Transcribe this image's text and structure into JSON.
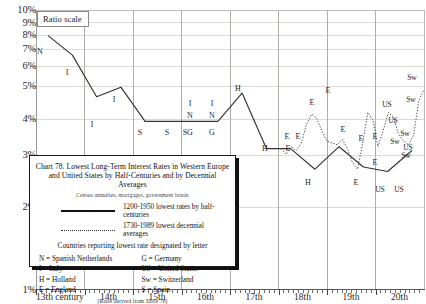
{
  "chart_data": {
    "type": "line",
    "title": "Chart 78. Lowest Long-Term Interest Rates in Western Europe and United States by Half-Centuries and by Decennial Averages",
    "subtitle": "Census annuities, mortgages, government bonds",
    "source_note": "(Rates derived from Table 76)",
    "ylabel": "",
    "xlabel": "",
    "scale_note": "Ratio scale",
    "yscale": "log",
    "ylim": [
      1,
      10
    ],
    "ytick_labels": [
      "10%",
      "9%",
      "8%",
      "7%",
      "6%",
      "5%",
      "4%",
      "3%",
      "2%",
      "1%"
    ],
    "ytick_values": [
      10,
      9,
      8,
      7,
      6,
      5,
      4,
      3,
      2,
      1
    ],
    "xtick_labels": [
      "13th century",
      "14th",
      "15th",
      "16th",
      "17th",
      "18th",
      "19th",
      "20th"
    ],
    "legend": [
      {
        "style": "solid",
        "label": "1200-1950 lowest rates by half-centuries"
      },
      {
        "style": "dotted",
        "label": "1730-1989 lowest decennial averages"
      }
    ],
    "key_note": "Countries reporting lowest rate designated by letter",
    "key_left": [
      "N = Spanish Netherlands",
      "I = Italy",
      "H = Holland",
      "E = England"
    ],
    "key_right": [
      "G = Germany",
      "US = United States",
      "Sw = Switzerland",
      "S = Spain"
    ],
    "series": [
      {
        "name": "1200-1950 lowest rates by half-centuries",
        "style": "solid",
        "points": [
          {
            "century": "13th-1",
            "value": 8.1
          },
          {
            "century": "13th-2",
            "value": 6.9
          },
          {
            "century": "14th-1",
            "value": 4.9
          },
          {
            "century": "14th-2",
            "value": 5.3
          },
          {
            "century": "15th-1",
            "value": 4.0
          },
          {
            "century": "15th-2",
            "value": 4.0
          },
          {
            "century": "16th-1",
            "value": 4.0
          },
          {
            "century": "16th-2",
            "value": 4.0
          },
          {
            "century": "17th-1",
            "value": 5.05
          },
          {
            "century": "17th-2",
            "value": 3.2
          },
          {
            "century": "18th-1",
            "value": 3.2
          },
          {
            "century": "18th-2",
            "value": 2.7
          },
          {
            "century": "19th-1",
            "value": 3.25
          },
          {
            "century": "19th-2",
            "value": 2.75
          },
          {
            "century": "20th-1",
            "value": 2.65
          },
          {
            "century": "20th-2",
            "value": 3.15
          }
        ]
      },
      {
        "name": "1730-1989 lowest decennial averages",
        "style": "dotted",
        "values": [
          3.2,
          3.05,
          3.25,
          3.15,
          3.35,
          3.9,
          4.25,
          4.1,
          3.7,
          3.4,
          3.35,
          3.3,
          3.45,
          3.2,
          2.85,
          2.7,
          3.35,
          4.3,
          4.05,
          3.25,
          3.7,
          4.3,
          4.15,
          3.6,
          3.4,
          3.3,
          3.6,
          4.75,
          5.2
        ]
      }
    ],
    "solid_letters": [
      {
        "label": "N",
        "x": 40,
        "y": 52
      },
      {
        "label": "I",
        "x": 67,
        "y": 73
      },
      {
        "label": "I",
        "x": 92,
        "y": 125
      },
      {
        "label": "I",
        "x": 114,
        "y": 100
      },
      {
        "label": "S",
        "x": 140,
        "y": 133
      },
      {
        "label": "S",
        "x": 167,
        "y": 133
      },
      {
        "label": "S",
        "x": 185,
        "y": 133
      },
      {
        "label": "G",
        "x": 190,
        "y": 133
      },
      {
        "label": "I",
        "x": 190,
        "y": 104
      },
      {
        "label": "N",
        "x": 190,
        "y": 116
      },
      {
        "label": "G",
        "x": 212,
        "y": 133
      },
      {
        "label": "I",
        "x": 212,
        "y": 104
      },
      {
        "label": "N",
        "x": 212,
        "y": 116
      },
      {
        "label": "H",
        "x": 238,
        "y": 89
      },
      {
        "label": "H",
        "x": 265,
        "y": 149
      },
      {
        "label": "E",
        "x": 288,
        "y": 149
      },
      {
        "label": "H",
        "x": 308,
        "y": 183
      },
      {
        "label": "E",
        "x": 356,
        "y": 183
      },
      {
        "label": "E",
        "x": 375,
        "y": 163
      },
      {
        "label": "US",
        "x": 380,
        "y": 190
      },
      {
        "label": "US",
        "x": 399,
        "y": 190
      }
    ],
    "dotted_letters": [
      {
        "label": "E",
        "x": 287,
        "y": 137
      },
      {
        "label": "E",
        "x": 298,
        "y": 137
      },
      {
        "label": "E",
        "x": 312,
        "y": 103
      },
      {
        "label": "E",
        "x": 328,
        "y": 91
      },
      {
        "label": "E",
        "x": 343,
        "y": 130
      },
      {
        "label": "E",
        "x": 361,
        "y": 139
      },
      {
        "label": "E",
        "x": 375,
        "y": 137
      },
      {
        "label": "US",
        "x": 387,
        "y": 105
      },
      {
        "label": "US",
        "x": 393,
        "y": 121
      },
      {
        "label": "Sw",
        "x": 395,
        "y": 142
      },
      {
        "label": "Sw",
        "x": 405,
        "y": 134
      },
      {
        "label": "Sw",
        "x": 406,
        "y": 156
      },
      {
        "label": "US",
        "x": 408,
        "y": 148
      },
      {
        "label": "Sw",
        "x": 411,
        "y": 100
      },
      {
        "label": "Sw",
        "x": 412,
        "y": 78
      }
    ]
  }
}
